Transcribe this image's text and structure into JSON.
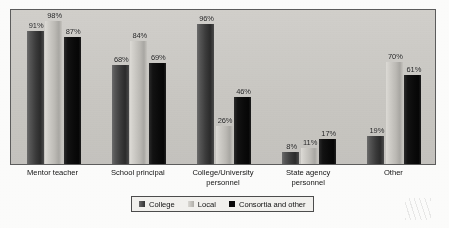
{
  "chart_data": {
    "type": "bar",
    "title": "",
    "subtitle": "",
    "xlabel": "",
    "ylabel": "",
    "ylim": [
      0,
      100
    ],
    "grid": false,
    "legend_position": "bottom",
    "value_suffix": "%",
    "categories": [
      "Mentor teacher",
      "School principal",
      "College/University\npersonnel",
      "State agency\npersonnel",
      "Other"
    ],
    "series": [
      {
        "name": "College",
        "color": "#3a3a3a",
        "values": [
          91,
          68,
          96,
          8,
          19
        ]
      },
      {
        "name": "Local",
        "color": "#bdbbb6",
        "values": [
          98,
          84,
          26,
          11,
          70
        ]
      },
      {
        "name": "Consortia and other",
        "color": "#0a0a0a",
        "values": [
          87,
          69,
          46,
          17,
          61
        ]
      }
    ],
    "data_labels": [
      [
        "91%",
        "98%",
        "87%"
      ],
      [
        "68%",
        "84%",
        "69%"
      ],
      [
        "96%",
        "26%",
        "46%"
      ],
      [
        "8%",
        "11%",
        "17%"
      ],
      [
        "19%",
        "70%",
        "61%"
      ]
    ]
  },
  "legend": {
    "items": [
      {
        "label": "College"
      },
      {
        "label": "Local"
      },
      {
        "label": "Consortia and other"
      }
    ]
  },
  "colors": {
    "plot_background": "#cfcdc8",
    "frame_border": "#5d5d5d",
    "page_background": "#fdfdfc",
    "text": "#131313"
  }
}
